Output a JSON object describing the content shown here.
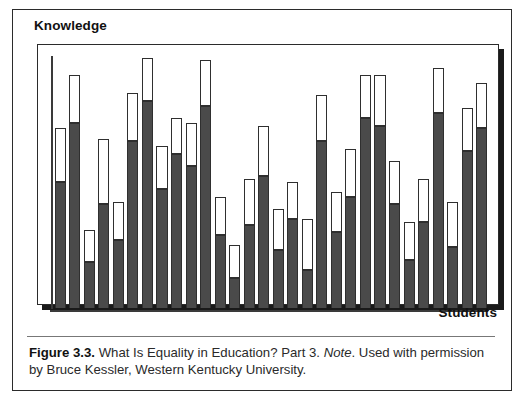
{
  "figure": {
    "axis_label_y": "Knowledge",
    "axis_label_x": "Students",
    "caption_label": "Figure 3.3.",
    "caption_text_1": " What Is Equality in Education? Part 3. ",
    "caption_note": "Note",
    "caption_text_2": ". Used with permission by Bruce Kessler, Western Kentucky University.",
    "colors": {
      "bar_fill": "#4a4a4a",
      "bar_outline": "#2f2f2f",
      "bar_unfilled": "#ffffff",
      "frame": "#2b2b2b",
      "shadow": "#1a1a1a",
      "text": "#2a2a2a"
    }
  },
  "chart_data": {
    "type": "bar",
    "title": "What Is Equality in Education? Part 3",
    "xlabel": "Students",
    "ylabel": "Knowledge",
    "ylim": [
      0,
      100
    ],
    "grid": false,
    "legend": "none",
    "stacked": true,
    "note": "Each bar is a student: the dark lower segment is knowledge attained, the white outlined upper segment is remaining potential. Axes have no numeric tick labels.",
    "categories": [
      "S1",
      "S2",
      "S3",
      "S4",
      "S5",
      "S6",
      "S7",
      "S8",
      "S9",
      "S10",
      "S11",
      "S12",
      "S13",
      "S14",
      "S15",
      "S16",
      "S17",
      "S18",
      "S19",
      "S20",
      "S21",
      "S22",
      "S23",
      "S24",
      "S25",
      "S26",
      "S27",
      "S28",
      "S29",
      "S30"
    ],
    "series": [
      {
        "name": "Knowledge attained",
        "values": [
          50,
          73,
          18,
          41,
          27,
          66,
          82,
          47,
          61,
          56,
          80,
          29,
          12,
          33,
          52,
          23,
          35,
          15,
          66,
          30,
          44,
          75,
          72,
          41,
          19,
          34,
          77,
          24,
          62,
          71
        ]
      },
      {
        "name": "Remaining potential",
        "values": [
          21,
          19,
          13,
          26,
          15,
          19,
          17,
          17,
          14,
          17,
          18,
          15,
          13,
          18,
          20,
          16,
          15,
          20,
          18,
          16,
          19,
          17,
          20,
          17,
          15,
          17,
          18,
          18,
          17,
          18
        ]
      }
    ],
    "totals": [
      71,
      92,
      31,
      67,
      42,
      85,
      99,
      64,
      75,
      73,
      98,
      44,
      25,
      51,
      72,
      39,
      50,
      35,
      84,
      46,
      63,
      92,
      92,
      58,
      34,
      51,
      95,
      42,
      79,
      89
    ]
  }
}
